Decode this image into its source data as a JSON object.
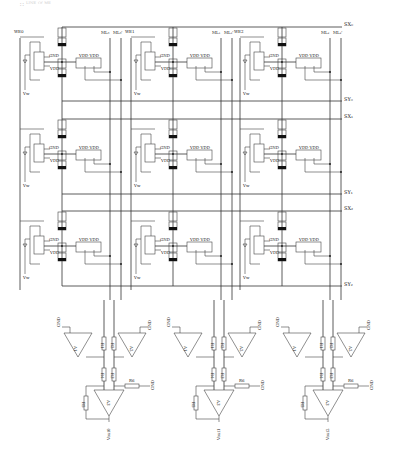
{
  "caption": "∷ ᴸᴵᴺᴱ ᴼᶠ ᴹᴱ",
  "rows": [
    {
      "sx": "SX₀",
      "sy": "SY₀",
      "top": 27,
      "bottom": 101
    },
    {
      "sx": "SX₁",
      "sy": "SY₁",
      "top": 119,
      "bottom": 194
    },
    {
      "sx": "SX₂",
      "sy": "SY₂",
      "top": 211,
      "bottom": 286
    }
  ],
  "columns": [
    {
      "we": "WE0",
      "ml_a": "ML₀",
      "ml_b": "ML₀'",
      "x": 0
    },
    {
      "we": "WE1",
      "ml_a": "ML₁",
      "ml_b": "ML₁'",
      "x": 111
    },
    {
      "we": "WE2",
      "ml_a": "ML₂",
      "ml_b": "ML₂'",
      "x": 220
    }
  ],
  "cell": {
    "gnd": "GND",
    "vdd": "VDD",
    "vdd_pair": "VDD VDD",
    "vw": "Vw"
  },
  "amplifiers": [
    {
      "a1": "A1",
      "a2": "A2",
      "a3": "A3",
      "r1": "R1",
      "r2": "R2",
      "r3": "R3",
      "r4": "R4",
      "r5": "R5",
      "r6": "R6",
      "gnd": "GND",
      "vout": "Vout0"
    },
    {
      "a1": "A1",
      "a2": "A2",
      "a3": "A3",
      "r1": "R1",
      "r2": "R2",
      "r3": "R3",
      "r4": "R4",
      "r5": "R5",
      "r6": "R6",
      "gnd": "GND",
      "vout": "Vout1"
    },
    {
      "a1": "A1",
      "a2": "A2",
      "a3": "A3",
      "r1": "R1",
      "r2": "R2",
      "r3": "R3",
      "r4": "R4",
      "r5": "R5",
      "r6": "R6",
      "gnd": "GND",
      "vout": "Vout2"
    }
  ]
}
